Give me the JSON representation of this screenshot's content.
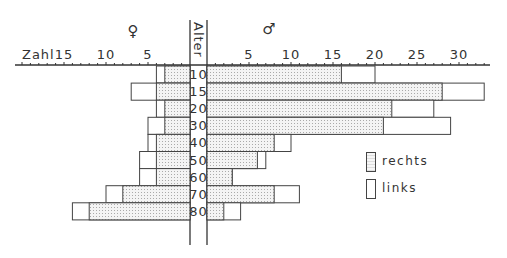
{
  "chart_data": {
    "type": "bar",
    "orientation": "horizontal-butterfly",
    "title": "",
    "center_label": "Alter",
    "axis_label": "Zahl",
    "left_group": {
      "symbol": "♀",
      "name": "female"
    },
    "right_group": {
      "symbol": "♂",
      "name": "male"
    },
    "categories": [
      "10",
      "15",
      "20",
      "30",
      "40",
      "50",
      "60",
      "70",
      "80"
    ],
    "left_ticks": [
      15,
      10,
      5
    ],
    "right_ticks": [
      5,
      10,
      15,
      20,
      25,
      30
    ],
    "xlim_left": [
      0,
      20
    ],
    "xlim_right": [
      0,
      33
    ],
    "series": [
      {
        "name": "rechts",
        "side": "female",
        "values": [
          3,
          4,
          3,
          3,
          4,
          4,
          4,
          8,
          12
        ]
      },
      {
        "name": "links",
        "side": "female",
        "values": [
          4,
          7,
          4,
          5,
          5,
          6,
          6,
          10,
          14
        ]
      },
      {
        "name": "rechts",
        "side": "male",
        "values": [
          16,
          28,
          22,
          21,
          8,
          6,
          3,
          8,
          2
        ]
      },
      {
        "name": "links",
        "side": "male",
        "values": [
          20,
          33,
          27,
          29,
          10,
          7,
          3,
          11,
          4
        ]
      }
    ],
    "note": "links values are cumulative bar end (rechts segment shaded, links segment white continuation)",
    "legend": [
      {
        "label": "rechts",
        "pattern": "dotted"
      },
      {
        "label": "links",
        "pattern": "white"
      }
    ],
    "grid": false
  },
  "labels": {
    "alter": "Alter",
    "zahl": "Zahl",
    "female_symbol": "♀",
    "male_symbol": "♂",
    "legend_rechts": "rechts",
    "legend_links": "links"
  }
}
